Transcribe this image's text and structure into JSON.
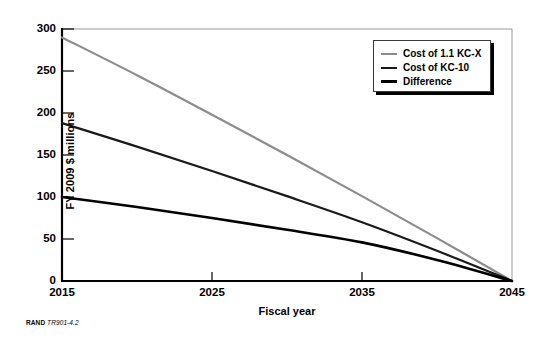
{
  "chart_data": {
    "type": "line",
    "title": "",
    "xlabel": "Fiscal year",
    "ylabel": "FY 2009 $ millions",
    "xlim": [
      2015,
      2045
    ],
    "ylim": [
      0,
      300
    ],
    "grid": false,
    "legend_position": "top-right",
    "xticks": [
      "2015",
      "2025",
      "2035",
      "2045"
    ],
    "yticks": [
      "0",
      "50",
      "100",
      "150",
      "200",
      "250",
      "300"
    ],
    "x": [
      2015,
      2020,
      2025,
      2030,
      2035,
      2040,
      2045
    ],
    "series": [
      {
        "name": "Cost of 1.1 KC-X",
        "color": "#8c8c8c",
        "width": 2.2,
        "values": [
          290,
          245,
          198,
          150,
          101,
          51,
          0
        ]
      },
      {
        "name": "Cost of KC-10",
        "color": "#1a1a1a",
        "width": 2.2,
        "values": [
          188,
          160,
          131,
          101,
          70,
          36,
          0
        ]
      },
      {
        "name": "Difference",
        "color": "#000000",
        "width": 2.6,
        "values": [
          100,
          88,
          75,
          61,
          46,
          25,
          0
        ]
      }
    ]
  },
  "legend": {
    "items": [
      {
        "label": "Cost of 1.1 KC-X",
        "color": "#8c8c8c",
        "thickness": "2px"
      },
      {
        "label": "Cost of KC-10",
        "color": "#1a1a1a",
        "thickness": "2px"
      },
      {
        "label": "Difference",
        "color": "#000000",
        "thickness": "3px"
      }
    ]
  },
  "axes": {
    "ylabel": "FY 2009 $ millions",
    "xlabel": "Fiscal year",
    "yticks": [
      "300",
      "250",
      "200",
      "150",
      "100",
      "50",
      "0"
    ],
    "xticks": [
      "2015",
      "2025",
      "2035",
      "2045"
    ]
  },
  "source": {
    "publisher": "RAND",
    "figure_id": "TR901-4.2"
  }
}
